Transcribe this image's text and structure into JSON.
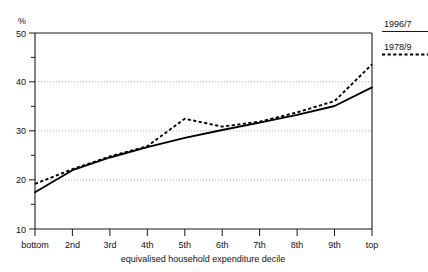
{
  "chart_data": {
    "type": "line",
    "title": "",
    "subtitle": "",
    "xlabel": "equivalised household expenditure decile",
    "ylabel": "%",
    "categories": [
      "bottom",
      "2nd",
      "3rd",
      "4th",
      "5th",
      "6th",
      "7th",
      "8th",
      "9th",
      "top"
    ],
    "ylim": [
      10,
      50
    ],
    "yticks": [
      10,
      20,
      30,
      40,
      50
    ],
    "yticklabels": [
      "10",
      "20",
      "30",
      "40",
      "50"
    ],
    "y_minor_ticks": [
      15,
      25,
      35,
      45
    ],
    "grid": "horizontal-dotted-at-20-30-40",
    "legend_position": "right-outside-top",
    "series": [
      {
        "name": "1996/7",
        "style": "solid",
        "values": [
          17.5,
          22.0,
          24.6,
          26.7,
          28.6,
          30.2,
          31.7,
          33.3,
          35.1,
          38.9
        ]
      },
      {
        "name": "1978/9",
        "style": "dashed",
        "values": [
          19.2,
          22.2,
          24.8,
          26.9,
          32.5,
          30.9,
          31.9,
          33.8,
          36.1,
          43.6
        ]
      }
    ]
  },
  "axes": {
    "y_unit_label": "%",
    "x_axis_title": "equivalised household expenditure decile"
  },
  "legend": {
    "items": [
      {
        "label": "1996/7",
        "style": "solid"
      },
      {
        "label": "1978/9",
        "style": "dashed"
      }
    ]
  }
}
